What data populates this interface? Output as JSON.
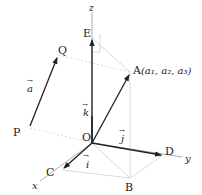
{
  "diagram": {
    "title": "",
    "axes": {
      "x": {
        "label": "x"
      },
      "y": {
        "label": "y"
      },
      "z": {
        "label": "z"
      }
    },
    "points": {
      "O": {
        "label": "O"
      },
      "A": {
        "label": "A",
        "coords": "(a₁, a₂, a₃)"
      },
      "B": {
        "label": "B"
      },
      "C": {
        "label": "C"
      },
      "D": {
        "label": "D"
      },
      "E": {
        "label": "E"
      },
      "P": {
        "label": "P"
      },
      "Q": {
        "label": "Q"
      }
    },
    "vectors": {
      "a": {
        "label": "a",
        "arrow": "→"
      },
      "i": {
        "label": "i",
        "arrow": "→"
      },
      "j": {
        "label": "j",
        "arrow": "→"
      },
      "k": {
        "label": "k",
        "arrow": "→"
      }
    },
    "colors": {
      "vector": "#222222",
      "axis": "#999999",
      "guide": "#cccccc"
    }
  }
}
